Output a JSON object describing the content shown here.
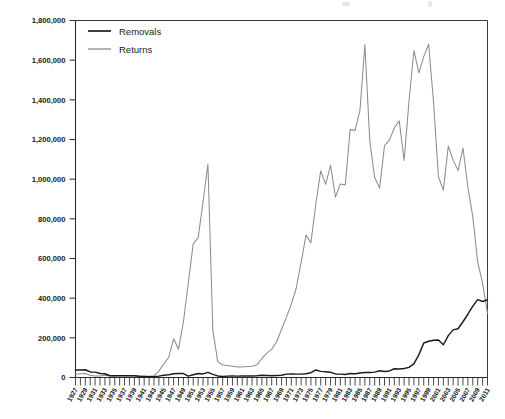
{
  "chart_data": {
    "type": "line",
    "title": "",
    "subtitle": "",
    "xlabel": "",
    "ylabel": "",
    "ylim": [
      0,
      1800000
    ],
    "yticks": [
      0,
      200000,
      400000,
      600000,
      800000,
      1000000,
      1200000,
      1400000,
      1600000,
      1800000
    ],
    "ytick_labels": [
      "0",
      "200,000",
      "400,000",
      "600,000",
      "800,000",
      "1,000,000",
      "1,200,000",
      "1,400,000",
      "1,600,000",
      "1,800,000"
    ],
    "grid": false,
    "legend_position": "top-left",
    "legend": [
      "Removals",
      "Returns"
    ],
    "colors": {
      "removals": "#1b1b1b",
      "returns": "#8d8d8d",
      "axis": "#2b2b2b",
      "background": "#ffffff"
    },
    "x": [
      1927,
      1928,
      1929,
      1930,
      1931,
      1932,
      1933,
      1934,
      1935,
      1936,
      1937,
      1938,
      1939,
      1940,
      1941,
      1942,
      1943,
      1944,
      1945,
      1946,
      1947,
      1948,
      1949,
      1950,
      1951,
      1952,
      1953,
      1954,
      1955,
      1956,
      1957,
      1958,
      1959,
      1960,
      1961,
      1962,
      1963,
      1964,
      1965,
      1966,
      1967,
      1968,
      1969,
      1970,
      1971,
      1972,
      1973,
      1974,
      1975,
      1976,
      1977,
      1978,
      1979,
      1980,
      1981,
      1982,
      1983,
      1984,
      1985,
      1986,
      1987,
      1988,
      1989,
      1990,
      1991,
      1992,
      1993,
      1994,
      1995,
      1996,
      1997,
      1998,
      1999,
      2000,
      2001,
      2002,
      2003,
      2004,
      2005,
      2006,
      2007,
      2008,
      2009,
      2010,
      2011
    ],
    "xtick_labels": [
      "1927",
      "1929",
      "1931",
      "1933",
      "1935",
      "1937",
      "1939",
      "1941",
      "1943",
      "1945",
      "1947",
      "1949",
      "1951",
      "1953",
      "1955",
      "1957",
      "1959",
      "1961",
      "1963",
      "1965",
      "1967",
      "1969",
      "1971",
      "1973",
      "1975",
      "1977",
      "1979",
      "1981",
      "1983",
      "1985",
      "1987",
      "1989",
      "1991",
      "1993",
      "1995",
      "1997",
      "1999",
      "2001",
      "2003",
      "2005",
      "2007",
      "2009",
      "2011"
    ],
    "series": [
      {
        "name": "Removals",
        "color": "#1b1b1b",
        "values": [
          38000,
          38000,
          39000,
          28000,
          27000,
          20000,
          19000,
          9000,
          9000,
          9000,
          9000,
          9000,
          9000,
          6000,
          5000,
          4000,
          4000,
          7000,
          11000,
          14000,
          19000,
          20000,
          20000,
          7000,
          14000,
          20000,
          18000,
          26000,
          16000,
          8000,
          5000,
          7000,
          8000,
          7000,
          8000,
          8000,
          8000,
          9000,
          11000,
          10000,
          9000,
          10000,
          11000,
          17000,
          18000,
          17000,
          17000,
          19000,
          24000,
          38000,
          31000,
          29000,
          26000,
          18000,
          17000,
          15000,
          20000,
          19000,
          23000,
          25000,
          25000,
          27000,
          34000,
          30000,
          33000,
          44000,
          43000,
          45000,
          51000,
          70000,
          114000,
          174000,
          183000,
          188000,
          189000,
          165000,
          211000,
          240000,
          246000,
          281000,
          319000,
          360000,
          393000,
          383000,
          392000
        ]
      },
      {
        "name": "Returns",
        "color": "#8d8d8d",
        "values": [
          15000,
          19000,
          20000,
          11000,
          8000,
          8000,
          11000,
          8000,
          8000,
          10000,
          9000,
          9000,
          9000,
          8000,
          6000,
          6000,
          9000,
          32000,
          69000,
          101000,
          195000,
          142000,
          280000,
          477000,
          674000,
          704000,
          885000,
          1075000,
          240000,
          80000,
          63000,
          60000,
          57000,
          53000,
          53000,
          55000,
          57000,
          64000,
          96000,
          123000,
          142000,
          180000,
          242000,
          303000,
          370000,
          450000,
          580000,
          718000,
          680000,
          876000,
          1042000,
          974000,
          1070000,
          910000,
          976000,
          971000,
          1251000,
          1246000,
          1348000,
          1679000,
          1191000,
          1008000,
          955000,
          1169000,
          1197000,
          1258000,
          1294000,
          1094000,
          1394000,
          1649000,
          1536000,
          1618000,
          1680000,
          1387000,
          1012000,
          945000,
          1166000,
          1096000,
          1043000,
          1157000,
          960000,
          811000,
          582000,
          476000,
          323000
        ]
      }
    ]
  },
  "legend": {
    "items": [
      {
        "label": "Removals",
        "color": "#1b1b1b"
      },
      {
        "label": "Returns",
        "color": "#8d8d8d"
      }
    ]
  },
  "axes": {
    "y_labels": [
      "1,800,000",
      "1,600,000",
      "1,400,000",
      "1,200,000",
      "1,000,000",
      "800,000",
      "600,000",
      "400,000",
      "200,000",
      "0"
    ],
    "x_labels": [
      "1927",
      "1929",
      "1931",
      "1933",
      "1935",
      "1937",
      "1939",
      "1941",
      "1943",
      "1945",
      "1947",
      "1949",
      "1951",
      "1953",
      "1955",
      "1957",
      "1959",
      "1961",
      "1963",
      "1965",
      "1967",
      "1969",
      "1971",
      "1973",
      "1975",
      "1977",
      "1979",
      "1981",
      "1983",
      "1985",
      "1987",
      "1989",
      "1991",
      "1993",
      "1995",
      "1997",
      "1999",
      "2001",
      "2003",
      "2005",
      "2007",
      "2009",
      "2011"
    ]
  }
}
